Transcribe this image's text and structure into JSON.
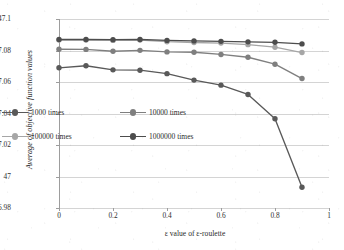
{
  "chart_data": {
    "type": "line",
    "title": "",
    "xlabel": "ε value of ε-roulette",
    "ylabel": "Average of objective function values",
    "x": [
      0,
      0.1,
      0.2,
      0.3,
      0.4,
      0.5,
      0.6,
      0.7,
      0.8,
      0.9
    ],
    "xlim": [
      0,
      1
    ],
    "ylim": [
      46.98,
      47.1
    ],
    "xticks": [
      "0",
      "0.2",
      "0.4",
      "0.6",
      "0.8",
      "1"
    ],
    "xtick_values": [
      0,
      0.2,
      0.4,
      0.6,
      0.8,
      1
    ],
    "yticks": [
      "46.98",
      "47",
      "47.02",
      "47.04",
      "47.06",
      "47.08",
      "47.1"
    ],
    "ytick_values": [
      46.98,
      47.0,
      47.02,
      47.04,
      47.06,
      47.08,
      47.1
    ],
    "grid": "horizontal",
    "legend_position": "inside-lower-left",
    "markers": "circle",
    "series": [
      {
        "name": "1000 times",
        "color": "#595959",
        "values": [
          47.069,
          47.0703,
          47.0677,
          47.0675,
          47.0653,
          47.0612,
          47.058,
          47.0521,
          47.0367,
          46.9932
        ]
      },
      {
        "name": "10000 times",
        "color": "#7f7f7f",
        "values": [
          47.0808,
          47.0807,
          47.0795,
          47.0801,
          47.0791,
          47.0789,
          47.0775,
          47.0757,
          47.0713,
          47.0622
        ]
      },
      {
        "name": "100000 times",
        "color": "#a6a6a6",
        "values": [
          47.0866,
          47.0866,
          47.0864,
          47.0866,
          47.0856,
          47.0851,
          47.0847,
          47.0837,
          47.0821,
          47.0787
        ]
      },
      {
        "name": "1000000 times",
        "color": "#4d4d4d",
        "values": [
          47.087,
          47.087,
          47.0869,
          47.087,
          47.0864,
          47.0861,
          47.0858,
          47.0855,
          47.0852,
          47.0842
        ]
      }
    ]
  },
  "legend": {
    "entries": [
      {
        "label": "1000 times",
        "color": "#595959"
      },
      {
        "label": "10000 times",
        "color": "#7f7f7f"
      },
      {
        "label": "100000 times",
        "color": "#a6a6a6"
      },
      {
        "label": "1000000 times",
        "color": "#4d4d4d"
      }
    ]
  },
  "colors": {
    "gridline": "#d4d4d4",
    "axis": "#9d9d9d",
    "text": "#2b2b2b",
    "background": "#ffffff"
  }
}
